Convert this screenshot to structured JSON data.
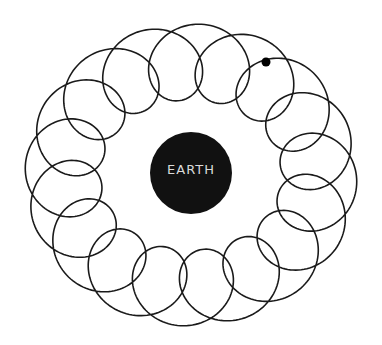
{
  "diagram": {
    "earth": {
      "label": "EARTH",
      "cx": 191,
      "cy": 173,
      "r": 41,
      "fill": "#111111",
      "label_color": "#d9d9d9"
    },
    "path": {
      "cx": 191,
      "cy": 175,
      "deferent_rx": 128,
      "deferent_ry": 113,
      "epicycle_r": 38,
      "loops": 16,
      "phase_deg": -62,
      "stroke": "#1a1a1a",
      "stroke_width": 1.6
    },
    "planet": {
      "cx": 266,
      "cy": 62,
      "r": 4.5,
      "fill": "#000000"
    }
  }
}
